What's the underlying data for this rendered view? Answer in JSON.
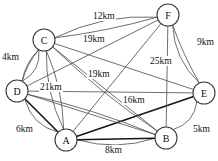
{
  "diagram": {
    "unit": "km",
    "background_color": "#ffffff",
    "edge_color": "#4a4a4a",
    "bold_edge_color": "#151515",
    "node_fill": "#ffffff",
    "node_stroke": "#3a3a3a",
    "nodes": [
      {
        "id": "A",
        "label": "A",
        "x": 66,
        "y": 140,
        "r": 11
      },
      {
        "id": "B",
        "label": "B",
        "x": 166,
        "y": 138,
        "r": 11
      },
      {
        "id": "C",
        "label": "C",
        "x": 44,
        "y": 40,
        "r": 11
      },
      {
        "id": "D",
        "label": "D",
        "x": 17,
        "y": 91,
        "r": 11
      },
      {
        "id": "E",
        "label": "E",
        "x": 204,
        "y": 93,
        "r": 11
      },
      {
        "id": "F",
        "label": "F",
        "x": 168,
        "y": 15,
        "r": 11
      }
    ],
    "edges": [
      {
        "from": "C",
        "to": "F",
        "label": "12km",
        "bold": false,
        "curve": -14
      },
      {
        "from": "C",
        "to": "F",
        "label": "19km",
        "bold": false,
        "curve": 4
      },
      {
        "from": "C",
        "to": "D",
        "label": "4km",
        "bold": false,
        "curve": -12
      },
      {
        "from": "D",
        "to": "E",
        "label": "21km",
        "bold": false,
        "curve": 0
      },
      {
        "from": "A",
        "to": "F",
        "label": "19km",
        "bold": false,
        "curve": 0
      },
      {
        "from": "D",
        "to": "F",
        "label": "25km",
        "bold": false,
        "curve": 0
      },
      {
        "from": "F",
        "to": "E",
        "label": "9km",
        "bold": false,
        "curve": 13
      },
      {
        "from": "A",
        "to": "E",
        "label": "16km",
        "bold": true,
        "curve": 0
      },
      {
        "from": "D",
        "to": "A",
        "label": "6km",
        "bold": true,
        "curve": 0
      },
      {
        "from": "B",
        "to": "E",
        "label": "5km",
        "bold": false,
        "curve": 12
      },
      {
        "from": "A",
        "to": "B",
        "label": "8km",
        "bold": false,
        "curve": 12
      },
      {
        "from": "A",
        "to": "C",
        "label": "",
        "bold": false,
        "curve": -10
      },
      {
        "from": "A",
        "to": "C",
        "label": "",
        "bold": false,
        "curve": 8
      },
      {
        "from": "A",
        "to": "D",
        "label": "",
        "bold": false,
        "curve": -14
      },
      {
        "from": "A",
        "to": "B",
        "label": "",
        "bold": true,
        "curve": 0
      },
      {
        "from": "B",
        "to": "C",
        "label": "",
        "bold": false,
        "curve": 0
      },
      {
        "from": "B",
        "to": "D",
        "label": "",
        "bold": false,
        "curve": 0
      },
      {
        "from": "B",
        "to": "F",
        "label": "",
        "bold": false,
        "curve": 0
      },
      {
        "from": "C",
        "to": "E",
        "label": "",
        "bold": false,
        "curve": 0
      },
      {
        "from": "C",
        "to": "D",
        "label": "",
        "bold": false,
        "curve": 6
      },
      {
        "from": "D",
        "to": "C",
        "label": "",
        "bold": false,
        "curve": -4
      },
      {
        "from": "E",
        "to": "F",
        "label": "",
        "bold": false,
        "curve": -3
      },
      {
        "from": "D",
        "to": "B",
        "label": "",
        "bold": false,
        "curve": -6
      },
      {
        "from": "C",
        "to": "B",
        "label": "",
        "bold": false,
        "curve": 6
      }
    ],
    "edge_labels": [
      {
        "text": "12km",
        "x": 92,
        "y": 11
      },
      {
        "text": "19km",
        "x": 82,
        "y": 34
      },
      {
        "text": "9km",
        "x": 196,
        "y": 37
      },
      {
        "text": "25km",
        "x": 149,
        "y": 56
      },
      {
        "text": "4km",
        "x": 1,
        "y": 52
      },
      {
        "text": "19km",
        "x": 87,
        "y": 69
      },
      {
        "text": "21km",
        "x": 39,
        "y": 82
      },
      {
        "text": "16km",
        "x": 122,
        "y": 95
      },
      {
        "text": "6km",
        "x": 15,
        "y": 124
      },
      {
        "text": "5km",
        "x": 192,
        "y": 124
      },
      {
        "text": "8km",
        "x": 104,
        "y": 145
      }
    ]
  }
}
